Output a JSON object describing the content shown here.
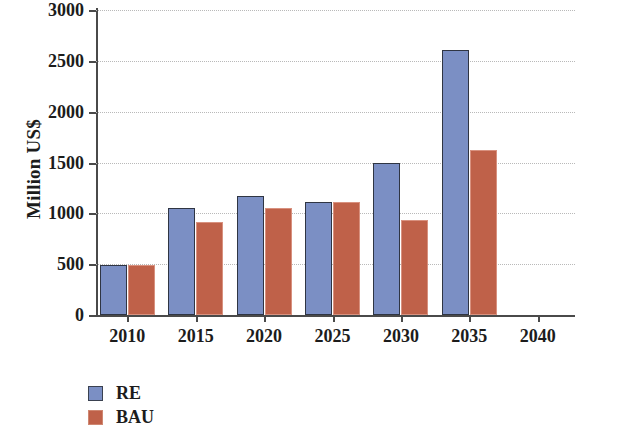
{
  "chart_data": {
    "type": "bar",
    "title": "",
    "subtitle": "",
    "xlabel": "",
    "ylabel": "Million US$",
    "categories": [
      "2010",
      "2015",
      "2020",
      "2025",
      "2030",
      "2035",
      "2040"
    ],
    "series": [
      {
        "name": "RE",
        "color": "#7b8fc4",
        "values": [
          490,
          1050,
          1170,
          1110,
          1500,
          2610,
          0
        ]
      },
      {
        "name": "BAU",
        "color": "#bf6149",
        "values": [
          490,
          910,
          1050,
          1110,
          930,
          1620,
          0
        ]
      }
    ],
    "ylim": [
      0,
      3000
    ],
    "ytick_values": [
      0,
      500,
      1000,
      1500,
      2000,
      2500,
      3000
    ],
    "ytick_labels": [
      "0",
      "500",
      "1000",
      "1500",
      "2000",
      "2500",
      "3000"
    ],
    "grid": true,
    "grid_style": "dotted",
    "grid_color": "#b9b9b9",
    "legend_position": "bottom-left",
    "axis_color": "#4a4a4a",
    "background_color": "#ffffff"
  },
  "legend": {
    "entries": [
      {
        "label": "RE",
        "swatch_name": "legend-swatch-re"
      },
      {
        "label": "BAU",
        "swatch_name": "legend-swatch-bau"
      }
    ]
  }
}
